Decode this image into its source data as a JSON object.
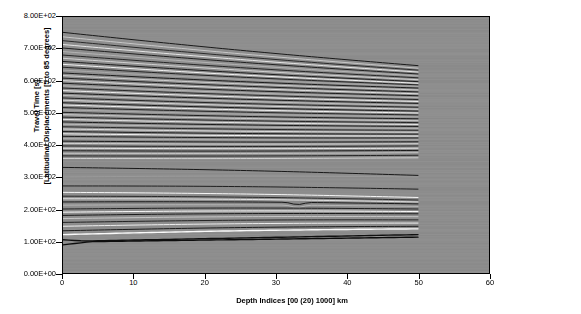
{
  "chart_data": {
    "type": "line",
    "title": "",
    "xlabel": "Depth Indices [00 (20) 1000] km",
    "ylabel": "Travel Time [s]  [Latitudinal Displacements [5 to 85 degrees]",
    "xlim": [
      0,
      60
    ],
    "ylim": [
      0,
      800
    ],
    "xticks": [
      0,
      10,
      20,
      30,
      40,
      50,
      60
    ],
    "xtick_labels": [
      "0",
      "10",
      "20",
      "30",
      "40",
      "50",
      "60"
    ],
    "yticks": [
      0,
      100,
      200,
      300,
      400,
      500,
      600,
      700,
      800
    ],
    "ytick_labels": [
      "0.00E+00",
      "1.00E+02",
      "2.00E+02",
      "3.00E+02",
      "4.00E+02",
      "5.00E+02",
      "6.00E+02",
      "7.00E+02",
      "8.00E+02"
    ],
    "grid": false,
    "legend": "none",
    "plot_background": "#8a8a8a",
    "series_note": "Dense family of ~70 travel-time branches, each spanning depth index 0 to 50, drawn as alternating dark and light grey curves over a grey background.",
    "series": [
      {
        "name": "branch-01",
        "color": "#1a1a1a",
        "x": [
          0,
          50
        ],
        "values": [
          752,
          648
        ]
      },
      {
        "name": "branch-02",
        "color": "#c8c8c8",
        "x": [
          0,
          50
        ],
        "values": [
          738,
          640
        ]
      },
      {
        "name": "branch-03",
        "color": "#2a2a2a",
        "x": [
          0,
          50
        ],
        "values": [
          726,
          634
        ]
      },
      {
        "name": "branch-04",
        "color": "#e6e6e6",
        "x": [
          0,
          50
        ],
        "values": [
          714,
          628
        ]
      },
      {
        "name": "branch-05",
        "color": "#1f1f1f",
        "x": [
          0,
          50
        ],
        "values": [
          703,
          622
        ]
      },
      {
        "name": "branch-06",
        "color": "#b4b4b4",
        "x": [
          0,
          50
        ],
        "values": [
          692,
          616
        ]
      },
      {
        "name": "branch-07",
        "color": "#262626",
        "x": [
          0,
          50
        ],
        "values": [
          681,
          610
        ]
      },
      {
        "name": "branch-08",
        "color": "#d2d2d2",
        "x": [
          0,
          50
        ],
        "values": [
          671,
          604
        ]
      },
      {
        "name": "branch-09",
        "color": "#1c1c1c",
        "x": [
          0,
          50
        ],
        "values": [
          661,
          598
        ]
      },
      {
        "name": "branch-10",
        "color": "#f2f2f2",
        "x": [
          0,
          50
        ],
        "values": [
          652,
          593
        ]
      },
      {
        "name": "branch-11",
        "color": "#232323",
        "x": [
          0,
          50
        ],
        "values": [
          643,
          588
        ]
      },
      {
        "name": "branch-12",
        "color": "#aaaaaa",
        "x": [
          0,
          50
        ],
        "values": [
          634,
          583
        ]
      },
      {
        "name": "branch-13",
        "color": "#1a1a1a",
        "x": [
          0,
          50
        ],
        "values": [
          625,
          578
        ]
      },
      {
        "name": "branch-14",
        "color": "#cfcfcf",
        "x": [
          0,
          50
        ],
        "values": [
          617,
          572
        ]
      },
      {
        "name": "branch-15",
        "color": "#202020",
        "x": [
          0,
          50
        ],
        "values": [
          609,
          566
        ]
      },
      {
        "name": "branch-16",
        "color": "#e0e0e0",
        "x": [
          0,
          50
        ],
        "values": [
          601,
          560
        ]
      },
      {
        "name": "branch-17",
        "color": "#1d1d1d",
        "x": [
          0,
          50
        ],
        "values": [
          593,
          554
        ]
      },
      {
        "name": "branch-18",
        "color": "#b8b8b8",
        "x": [
          0,
          50
        ],
        "values": [
          585,
          548
        ]
      },
      {
        "name": "branch-19",
        "color": "#272727",
        "x": [
          0,
          50
        ],
        "values": [
          578,
          542
        ]
      },
      {
        "name": "branch-20",
        "color": "#ededed",
        "x": [
          0,
          50
        ],
        "values": [
          570,
          536
        ]
      },
      {
        "name": "branch-21",
        "color": "#1b1b1b",
        "x": [
          0,
          50
        ],
        "values": [
          562,
          530
        ]
      },
      {
        "name": "branch-22",
        "color": "#c0c0c0",
        "x": [
          0,
          50
        ],
        "values": [
          555,
          524
        ]
      },
      {
        "name": "branch-23",
        "color": "#242424",
        "x": [
          0,
          50
        ],
        "values": [
          547,
          518
        ]
      },
      {
        "name": "branch-24",
        "color": "#d8d8d8",
        "x": [
          0,
          50
        ],
        "values": [
          540,
          512
        ]
      },
      {
        "name": "branch-25",
        "color": "#191919",
        "x": [
          0,
          50
        ],
        "values": [
          532,
          506
        ]
      },
      {
        "name": "branch-26",
        "color": "#f0f0f0",
        "x": [
          0,
          50
        ],
        "values": [
          525,
          500
        ]
      },
      {
        "name": "branch-27",
        "color": "#222222",
        "x": [
          0,
          50
        ],
        "values": [
          517,
          494
        ]
      },
      {
        "name": "branch-28",
        "color": "#adadad",
        "x": [
          0,
          50
        ],
        "values": [
          510,
          488
        ]
      },
      {
        "name": "branch-29",
        "color": "#1e1e1e",
        "x": [
          0,
          50
        ],
        "values": [
          502,
          482
        ]
      },
      {
        "name": "branch-30",
        "color": "#cccccc",
        "x": [
          0,
          50
        ],
        "values": [
          495,
          476
        ]
      },
      {
        "name": "branch-31",
        "color": "#252525",
        "x": [
          0,
          50
        ],
        "values": [
          487,
          470
        ]
      },
      {
        "name": "branch-32",
        "color": "#e4e4e4",
        "x": [
          0,
          50
        ],
        "values": [
          480,
          464
        ]
      },
      {
        "name": "branch-33",
        "color": "#1a1a1a",
        "x": [
          0,
          50
        ],
        "values": [
          472,
          458
        ]
      },
      {
        "name": "branch-34",
        "color": "#bbbbbb",
        "x": [
          0,
          50
        ],
        "values": [
          465,
          452
        ]
      },
      {
        "name": "branch-35",
        "color": "#282828",
        "x": [
          0,
          50
        ],
        "values": [
          457,
          446
        ]
      },
      {
        "name": "branch-36",
        "color": "#dcdcdc",
        "x": [
          0,
          50
        ],
        "values": [
          450,
          440
        ]
      },
      {
        "name": "branch-37",
        "color": "#1c1c1c",
        "x": [
          0,
          50
        ],
        "values": [
          442,
          434
        ]
      },
      {
        "name": "branch-38",
        "color": "#f4f4f4",
        "x": [
          0,
          50
        ],
        "values": [
          435,
          428
        ]
      },
      {
        "name": "branch-39",
        "color": "#212121",
        "x": [
          0,
          50
        ],
        "values": [
          427,
          422
        ]
      },
      {
        "name": "branch-40",
        "color": "#b0b0b0",
        "x": [
          0,
          50
        ],
        "values": [
          420,
          416
        ]
      },
      {
        "name": "branch-41",
        "color": "#1d1d1d",
        "x": [
          0,
          50
        ],
        "values": [
          412,
          410
        ]
      },
      {
        "name": "branch-42",
        "color": "#d4d4d4",
        "x": [
          0,
          50
        ],
        "values": [
          405,
          404
        ]
      },
      {
        "name": "branch-43",
        "color": "#262626",
        "x": [
          0,
          50
        ],
        "values": [
          397,
          397
        ]
      },
      {
        "name": "branch-44",
        "color": "#e8e8e8",
        "x": [
          0,
          50
        ],
        "values": [
          390,
          390
        ]
      },
      {
        "name": "branch-45",
        "color": "#1b1b1b",
        "x": [
          0,
          50
        ],
        "values": [
          382,
          383
        ]
      },
      {
        "name": "branch-46",
        "color": "#c4c4c4",
        "x": [
          0,
          50
        ],
        "values": [
          374,
          376
        ]
      },
      {
        "name": "branch-47",
        "color": "#232323",
        "x": [
          0,
          50
        ],
        "values": [
          366,
          368
        ]
      },
      {
        "name": "branch-48",
        "color": "#d0d0d0",
        "x": [
          0,
          50
        ],
        "values": [
          358,
          360
        ]
      },
      {
        "name": "branch-49",
        "color": "#181818",
        "x": [
          0,
          50
        ],
        "values": [
          330,
          305
        ]
      },
      {
        "name": "branch-50",
        "color": "#9a9a9a",
        "x": [
          0,
          50
        ],
        "values": [
          300,
          300
        ]
      },
      {
        "name": "branch-51",
        "color": "#1f1f1f",
        "x": [
          0,
          50
        ],
        "values": [
          272,
          262
        ]
      },
      {
        "name": "branch-52",
        "color": "#f6f6f6",
        "x": [
          0,
          50
        ],
        "values": [
          252,
          236
        ]
      },
      {
        "name": "branch-53",
        "color": "#2a2a2a",
        "x": [
          0,
          50
        ],
        "values": [
          240,
          228
        ]
      },
      {
        "name": "branch-54",
        "color": "#e2e2e2",
        "x": [
          0,
          50
        ],
        "values": [
          232,
          222
        ]
      },
      {
        "name": "branch-55",
        "color": "#191919",
        "x": [
          0,
          50
        ],
        "values": [
          222,
          216
        ]
      },
      {
        "name": "branch-56",
        "color": "#b6b6b6",
        "x": [
          0,
          50
        ],
        "values": [
          212,
          208
        ]
      },
      {
        "name": "branch-57",
        "color": "#202020",
        "x": [
          0,
          50
        ],
        "values": [
          200,
          200
        ]
      },
      {
        "name": "branch-58",
        "color": "#f8f8f8",
        "x": [
          0,
          50
        ],
        "values": [
          190,
          192
        ]
      },
      {
        "name": "branch-59",
        "color": "#1a1a1a",
        "x": [
          0,
          50
        ],
        "values": [
          180,
          185
        ]
      },
      {
        "name": "branch-60",
        "color": "#c6c6c6",
        "x": [
          0,
          50
        ],
        "values": [
          170,
          176
        ]
      },
      {
        "name": "branch-61",
        "color": "#252525",
        "x": [
          0,
          50
        ],
        "values": [
          158,
          166
        ]
      },
      {
        "name": "branch-62",
        "color": "#eeeeee",
        "x": [
          0,
          50
        ],
        "values": [
          146,
          156
        ]
      },
      {
        "name": "branch-63",
        "color": "#1c1c1c",
        "x": [
          0,
          50
        ],
        "values": [
          132,
          146
        ]
      },
      {
        "name": "branch-64",
        "color": "#fafafa",
        "x": [
          0,
          50
        ],
        "values": [
          120,
          138
        ]
      },
      {
        "name": "branch-65",
        "color": "#101010",
        "x": [
          0,
          50
        ],
        "values": [
          104,
          120
        ]
      },
      {
        "name": "branch-66",
        "color": "#0d0d0d",
        "x": [
          0,
          50
        ],
        "values": [
          88,
          112
        ]
      }
    ],
    "annotations": [
      {
        "text": "kink in low branch near depth index 33",
        "x": 33,
        "y": 196
      },
      {
        "text": "flat dark branch at ~100 s for depth 3 to 30",
        "x": 15,
        "y": 100
      }
    ]
  },
  "axes": {
    "x_label": "Depth Indices [00 (20) 1000] km",
    "y_label_line1": "Travel Time [s]",
    "y_label_line2": "[Latitudinal Displacements [5 to 85 degrees]",
    "x_tick_labels": [
      "0",
      "10",
      "20",
      "30",
      "40",
      "50",
      "60"
    ],
    "y_tick_labels": [
      "8.00E+02",
      "7.00E+02",
      "6.00E+02",
      "5.00E+02",
      "4.00E+02",
      "3.00E+02",
      "2.00E+02",
      "1.00E+02",
      "0.00E+00"
    ]
  }
}
